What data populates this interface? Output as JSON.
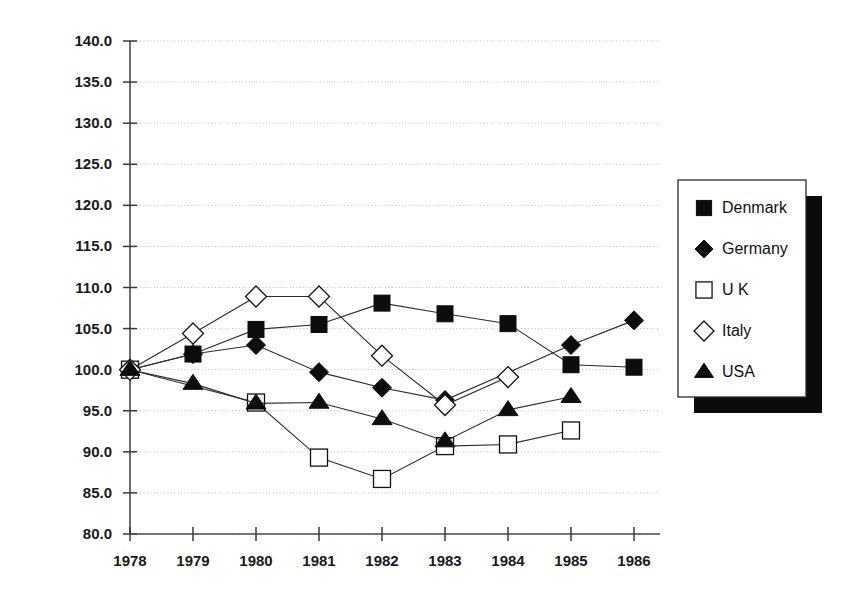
{
  "chart_data": {
    "type": "line",
    "title": "",
    "subtitle": "",
    "xlabel": "",
    "ylabel": "",
    "grid": true,
    "legend_position": "right",
    "x": [
      1978,
      1979,
      1980,
      1981,
      1982,
      1983,
      1984,
      1985,
      1986
    ],
    "categories": [
      "1978",
      "1979",
      "1980",
      "1981",
      "1982",
      "1983",
      "1984",
      "1985",
      "1986"
    ],
    "xlim": [
      1978,
      1986
    ],
    "ylim": [
      80.0,
      140.0
    ],
    "ytick_labels": [
      "140.0",
      "135.0",
      "130.0",
      "125.0",
      "120.0",
      "115.0",
      "110.0",
      "105.0",
      "100.0",
      "95.0",
      "90.0",
      "85.0",
      "80.0"
    ],
    "ytick_values": [
      140.0,
      135.0,
      130.0,
      125.0,
      120.0,
      115.0,
      110.0,
      105.0,
      100.0,
      95.0,
      90.0,
      85.0,
      80.0
    ],
    "series": [
      {
        "name": "Denmark",
        "marker": "filled-square",
        "values": [
          100.0,
          101.9,
          104.9,
          105.5,
          108.1,
          106.8,
          105.6,
          100.6,
          100.3
        ]
      },
      {
        "name": "Germany",
        "marker": "filled-diamond",
        "values": [
          100.0,
          101.9,
          103.0,
          99.7,
          97.8,
          96.3,
          null,
          103.0,
          106.0
        ]
      },
      {
        "name": "U K",
        "marker": "open-square",
        "values": [
          100.0,
          null,
          96.0,
          89.3,
          86.7,
          90.7,
          90.9,
          92.6,
          null
        ]
      },
      {
        "name": "Italy",
        "marker": "open-diamond",
        "values": [
          100.0,
          104.4,
          108.9,
          108.9,
          101.7,
          95.7,
          99.1,
          null,
          null
        ]
      },
      {
        "name": "USA",
        "marker": "filled-triangle",
        "values": [
          100.0,
          98.3,
          95.9,
          96.0,
          94.0,
          91.3,
          95.1,
          96.7,
          null
        ]
      }
    ]
  },
  "legend": {
    "entries": [
      {
        "label": "Denmark",
        "marker": "filled-square"
      },
      {
        "label": "Germany",
        "marker": "filled-diamond"
      },
      {
        "label": "U K",
        "marker": "open-square"
      },
      {
        "label": "Italy",
        "marker": "open-diamond"
      },
      {
        "label": "USA",
        "marker": "filled-triangle"
      }
    ]
  }
}
